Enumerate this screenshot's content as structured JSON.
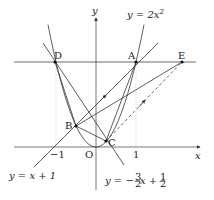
{
  "diagram": {
    "title": "",
    "axes": {
      "x_label": "x",
      "y_label": "y",
      "origin_label": "O",
      "tick_neg1": "−1",
      "tick_pos1": "1"
    },
    "curves": {
      "parabola": {
        "label": "y = 2x²",
        "label_main": "y = 2x",
        "label_exp": "2"
      },
      "line_AB": {
        "label": "y = x + 1"
      },
      "line_DC": {
        "label_prefix": "y = −",
        "frac1_num": "3",
        "frac1_den": "2",
        "label_mid": "x + ",
        "frac2_num": "1",
        "frac2_den": "2"
      }
    },
    "points": {
      "A": {
        "label": "A",
        "x": 1,
        "y": 2
      },
      "B": {
        "label": "B",
        "x": -0.5,
        "y": 0.5
      },
      "C": {
        "label": "C",
        "x": 0.25,
        "y": 0.125
      },
      "D": {
        "label": "D",
        "x": -1,
        "y": 2
      },
      "E": {
        "label": "E",
        "x": 2.15,
        "y": 2
      }
    },
    "colors": {
      "line": "#333333",
      "dotted": "#aaaaaa",
      "axis": "#555555"
    }
  }
}
